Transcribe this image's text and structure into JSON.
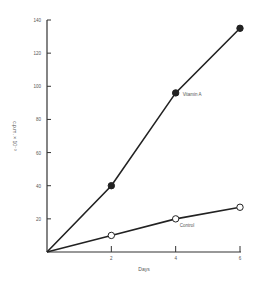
{
  "chart_data": {
    "type": "line",
    "title": "",
    "xlabel": "Days",
    "ylabel": "c.p.m. × 10⁻³",
    "x_ticks": [
      "2",
      "4",
      "6"
    ],
    "y_ticks": [
      "20",
      "40",
      "60",
      "80",
      "100",
      "120",
      "140"
    ],
    "xlim": [
      0,
      6
    ],
    "ylim": [
      0,
      140
    ],
    "grid": false,
    "series": [
      {
        "name": "Vitamin A",
        "marker": "filled-circle",
        "x": [
          0,
          2,
          4,
          6
        ],
        "y": [
          0,
          40,
          96,
          135
        ]
      },
      {
        "name": "Control",
        "marker": "open-circle",
        "x": [
          0,
          2,
          4,
          6
        ],
        "y": [
          0,
          10,
          20,
          27
        ]
      }
    ]
  }
}
